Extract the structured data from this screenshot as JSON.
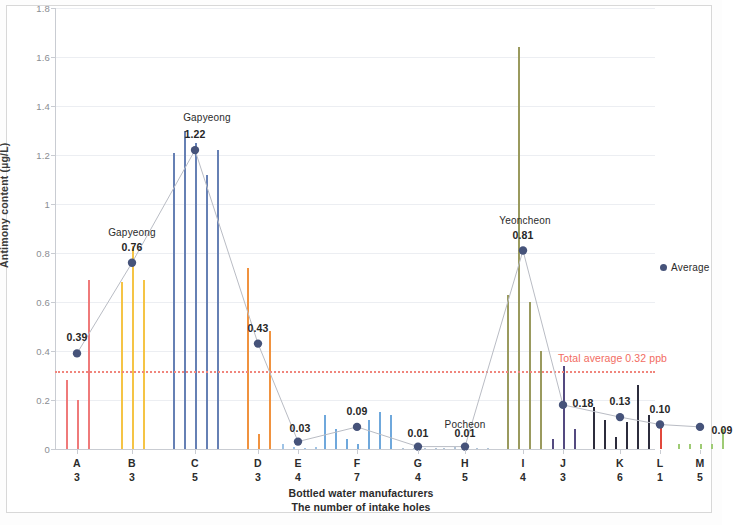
{
  "chart_data": {
    "type": "bar",
    "title": "",
    "xlabel": "Bottled water manufacturers / The number of intake holes",
    "ylabel": "Antimony content (µg/L)",
    "ylim": [
      0,
      1.8
    ],
    "yticks": [
      "0",
      "0.2",
      "0.4",
      "0.6",
      "0.8",
      "1",
      "1.2",
      "1.4",
      "1.6",
      "1.8"
    ],
    "grid": true,
    "legend": [
      {
        "name": "Average",
        "color": "#46537a",
        "marker": "circle"
      }
    ],
    "legend_position": "right",
    "categories": [
      "A",
      "B",
      "C",
      "D",
      "E",
      "F",
      "G",
      "H",
      "I",
      "J",
      "K",
      "L",
      "M"
    ],
    "intake_holes": [
      3,
      3,
      5,
      3,
      4,
      7,
      4,
      5,
      4,
      3,
      6,
      1,
      5
    ],
    "reference_line": {
      "label": "Total average 0.32 ppb",
      "value": 0.32,
      "color": "#f26c62",
      "style": "dotted"
    },
    "series": [
      {
        "name": "Average",
        "color": "#46537a",
        "values": [
          0.39,
          0.76,
          1.22,
          0.43,
          0.03,
          0.09,
          0.01,
          0.01,
          0.81,
          0.18,
          0.13,
          0.1,
          0.09
        ],
        "labels": [
          "0.39",
          "0.76",
          "1.22",
          "0.43",
          "0.03",
          "0.09",
          "0.01",
          "0.01",
          "0.81",
          "0.18",
          "0.13",
          "0.10",
          "0.09"
        ]
      }
    ],
    "annotations": [
      {
        "text": "Gapyeong",
        "category": "B"
      },
      {
        "text": "Gapyeong",
        "category": "C"
      },
      {
        "text": "Pocheon",
        "category": "H"
      },
      {
        "text": "Yeoncheon",
        "category": "I"
      }
    ],
    "groups": [
      {
        "category": "A",
        "color": "#ef7a7a",
        "holes": [
          0.28,
          0.2,
          0.69
        ]
      },
      {
        "category": "B",
        "color": "#f5c445",
        "holes": [
          0.68,
          0.83,
          0.69
        ]
      },
      {
        "category": "C",
        "color": "#6680b4",
        "holes": [
          1.21,
          1.3,
          1.25,
          1.12,
          1.22
        ]
      },
      {
        "category": "D",
        "color": "#f0923f",
        "holes": [
          0.74,
          0.06,
          0.48
        ]
      },
      {
        "category": "E",
        "color": "#9ec3e6",
        "holes": [
          0.02,
          0.01,
          0.005,
          0.01
        ]
      },
      {
        "category": "F",
        "color": "#6fa8dc",
        "holes": [
          0.14,
          0.08,
          0.04,
          0.02,
          0.12,
          0.15,
          0.14
        ]
      },
      {
        "category": "G",
        "color": "#b0c4d8",
        "holes": [
          0.004,
          0.004,
          0.004,
          0.004
        ]
      },
      {
        "category": "H",
        "color": "#b0c4d8",
        "holes": [
          0.004,
          0.01,
          0.02,
          0.004,
          0.004
        ]
      },
      {
        "category": "I",
        "color": "#9a9a5e",
        "holes": [
          0.63,
          1.64,
          0.6,
          0.4
        ]
      },
      {
        "category": "J",
        "color": "#544a80",
        "holes": [
          0.04,
          0.34,
          0.08
        ]
      },
      {
        "category": "K",
        "color": "#2c2c3c",
        "holes": [
          0.17,
          0.12,
          0.05,
          0.11,
          0.26,
          0.14
        ]
      },
      {
        "category": "L",
        "color": "#e2483c",
        "holes": [
          0.1
        ]
      },
      {
        "category": "M",
        "color": "#9ecb74",
        "holes": [
          0.02,
          0.02,
          0.02,
          0.02,
          0.08
        ]
      }
    ]
  },
  "axis": {
    "y_title": "Antimony content (µg/L)",
    "x_title_line1": "Bottled water manufacturers",
    "x_title_line2": "The number of intake holes"
  },
  "legend": {
    "average_label": "Average"
  },
  "reference": {
    "label": "Total average 0.32 ppb"
  }
}
